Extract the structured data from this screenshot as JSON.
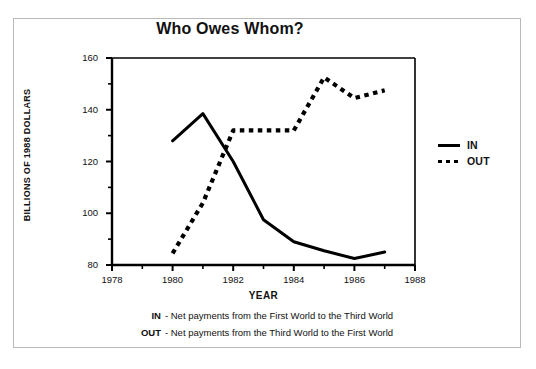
{
  "chart_data": {
    "type": "line",
    "title": "Who Owes Whom?",
    "xlabel": "YEAR",
    "ylabel": "BILLIONS OF 1988 DOLLARS",
    "xlim": [
      1978,
      1988
    ],
    "ylim": [
      80,
      160
    ],
    "x_major_ticks": [
      1978,
      1980,
      1982,
      1984,
      1986,
      1988
    ],
    "x_minor_ticks": [
      1979,
      1981,
      1983,
      1985,
      1987
    ],
    "y_major_ticks": [
      80,
      100,
      120,
      140,
      160
    ],
    "y_minor_ticks": [
      90,
      110,
      130,
      150
    ],
    "grid": false,
    "legend_position": "right",
    "x": [
      1980,
      1981,
      1982,
      1983,
      1984,
      1985,
      1986,
      1987
    ],
    "series": [
      {
        "name": "IN",
        "style": "solid",
        "color": "#000000",
        "values": [
          128,
          138.5,
          120,
          97.5,
          89,
          85.5,
          82.5,
          85
        ]
      },
      {
        "name": "OUT",
        "style": "dotted",
        "color": "#000000",
        "values": [
          84.5,
          104,
          132,
          132,
          132,
          152.5,
          144.5,
          147.5
        ]
      }
    ],
    "annotations": [
      "IN - Net payments from the First World to the Third World",
      "OUT - Net payments from the Third World to the First World"
    ]
  },
  "legend": {
    "items": [
      {
        "label": "IN",
        "style": "solid"
      },
      {
        "label": "OUT",
        "style": "dotted"
      }
    ]
  },
  "footnotes": [
    {
      "key": "IN",
      "text": "- Net payments from the First World to the Third World"
    },
    {
      "key": "OUT",
      "text": "- Net payments from the Third World to the First World"
    }
  ]
}
